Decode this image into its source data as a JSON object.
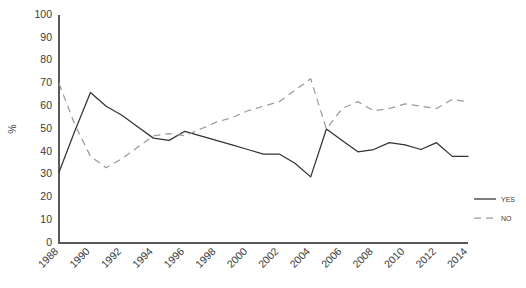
{
  "chart_data": {
    "type": "line",
    "title": "",
    "xlabel": "",
    "ylabel": "%",
    "ylim": [
      0,
      100
    ],
    "xlim": [
      1988,
      2014
    ],
    "grid": false,
    "legend_position": "right",
    "ytick_labels": [
      "100",
      "90",
      "80",
      "70",
      "60",
      "50",
      "40",
      "30",
      "20",
      "10",
      "0"
    ],
    "ytick_values": [
      100,
      90,
      80,
      70,
      60,
      50,
      40,
      30,
      20,
      10,
      0
    ],
    "xtick_labels": [
      "1988",
      "1990",
      "1992",
      "1994",
      "1996",
      "1998",
      "2000",
      "2002",
      "2004",
      "2006",
      "2008",
      "2010",
      "2012",
      "2014"
    ],
    "xtick_values": [
      1988,
      1990,
      1992,
      1994,
      1996,
      1998,
      2000,
      2002,
      2004,
      2006,
      2008,
      2010,
      2012,
      2014
    ],
    "x": [
      1988,
      1989,
      1990,
      1991,
      1992,
      1993,
      1994,
      1995,
      1996,
      1997,
      1998,
      1999,
      2000,
      2001,
      2002,
      2003,
      2004,
      2005,
      2006,
      2007,
      2008,
      2009,
      2010,
      2011,
      2012,
      2013,
      2014
    ],
    "series": [
      {
        "name": "Yes",
        "style": "solid",
        "color": "#333333",
        "values": [
          31,
          49,
          66,
          60,
          56,
          51,
          46,
          45,
          49,
          47,
          45,
          43,
          41,
          39,
          39,
          35,
          29,
          50,
          45,
          40,
          41,
          44,
          43,
          41,
          44,
          38,
          38
        ]
      },
      {
        "name": "No",
        "style": "dashed",
        "color": "#9a9a9a",
        "values": [
          70,
          52,
          38,
          33,
          37,
          42,
          47,
          48,
          47,
          50,
          53,
          55,
          58,
          60,
          62,
          67,
          72,
          50,
          59,
          62,
          58,
          59,
          61,
          60,
          59,
          63,
          62
        ]
      }
    ],
    "legend": [
      {
        "label": "Yes",
        "style": "solid",
        "color": "#333333"
      },
      {
        "label": "No",
        "style": "dashed",
        "color": "#9a9a9a"
      }
    ]
  },
  "layout": {
    "plot_left": 59,
    "plot_right": 468,
    "plot_top": 15,
    "plot_bottom": 243,
    "xlabel_rotation": -45
  }
}
